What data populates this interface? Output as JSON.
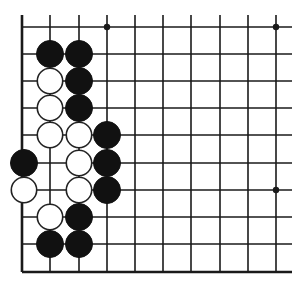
{
  "diagram": {
    "type": "go-board-corner",
    "grid": {
      "x": [
        22,
        50,
        79,
        107,
        135,
        163,
        191,
        220,
        248,
        276
      ],
      "y": [
        27,
        54,
        81,
        108,
        135,
        163,
        190,
        217,
        244,
        272
      ],
      "line_extend_right": 16,
      "line_extend_top": 12,
      "line_color": "#1a1a1a"
    },
    "star_points": [
      {
        "col": 3,
        "row": 0
      },
      {
        "col": 9,
        "row": 0
      },
      {
        "col": 9,
        "row": 6
      }
    ],
    "stones": [
      {
        "color": "black",
        "col": 1,
        "row": 1
      },
      {
        "color": "black",
        "col": 2,
        "row": 1
      },
      {
        "color": "white",
        "col": 1,
        "row": 2
      },
      {
        "color": "black",
        "col": 2,
        "row": 2
      },
      {
        "color": "white",
        "col": 1,
        "row": 3
      },
      {
        "color": "black",
        "col": 2,
        "row": 3
      },
      {
        "color": "white",
        "col": 1,
        "row": 4
      },
      {
        "color": "white",
        "col": 2,
        "row": 4
      },
      {
        "color": "black",
        "col": 3,
        "row": 4
      },
      {
        "color": "black",
        "col": 0,
        "row": 5
      },
      {
        "color": "white",
        "col": 2,
        "row": 5
      },
      {
        "color": "black",
        "col": 3,
        "row": 5
      },
      {
        "color": "white",
        "col": 0,
        "row": 6
      },
      {
        "color": "white",
        "col": 2,
        "row": 6
      },
      {
        "color": "black",
        "col": 3,
        "row": 6
      },
      {
        "color": "white",
        "col": 1,
        "row": 7
      },
      {
        "color": "black",
        "col": 2,
        "row": 7
      },
      {
        "color": "black",
        "col": 1,
        "row": 8
      },
      {
        "color": "black",
        "col": 2,
        "row": 8
      }
    ],
    "stone_radius": 13.5,
    "colors": {
      "black_stone": "#111111",
      "white_stone": "#ffffff",
      "background": "#ffffff"
    }
  }
}
